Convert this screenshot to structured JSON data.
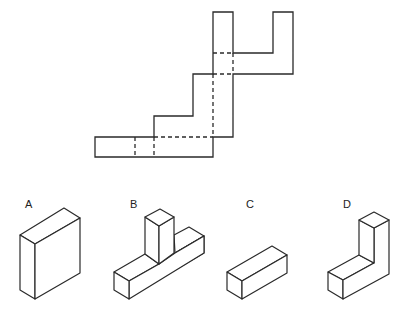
{
  "diagram": {
    "type": "cube-net-folding-puzzle",
    "net": {
      "description": "Unfolded net (pattern) of a 3D shape with solid cut lines and dashed fold lines"
    },
    "options": [
      {
        "label": "A",
        "shape": "flat square slab"
      },
      {
        "label": "B",
        "shape": "T-shaped block"
      },
      {
        "label": "C",
        "shape": "rectangular bar"
      },
      {
        "label": "D",
        "shape": "L-shaped block"
      }
    ],
    "colors": {
      "line": "#2a2a2a",
      "background": "#ffffff"
    }
  }
}
